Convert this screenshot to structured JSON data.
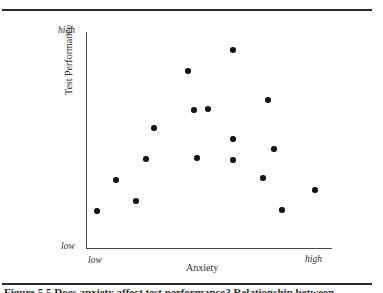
{
  "figure": {
    "caption": "Figure 5.5 Does anxiety affect test performance? Relationship between…",
    "top_rule": true,
    "bottom_rule": true
  },
  "chart_data": {
    "type": "scatter",
    "title": "",
    "xlabel": "Anxiety",
    "ylabel": "Test Performance",
    "x_tick_labels": [
      "low",
      "high"
    ],
    "y_tick_labels": [
      "low",
      "high"
    ],
    "xlim": [
      0,
      100
    ],
    "ylim": [
      0,
      100
    ],
    "grid": false,
    "legend": "none",
    "marker_color": "#141414",
    "axis_color": "#4a4a4a",
    "annotation": "Inverted-U relationship: performance peaks at moderate anxiety.",
    "points": [
      {
        "x": 59.8,
        "y": 92.1
      },
      {
        "x": 41.5,
        "y": 82.3
      },
      {
        "x": 74.0,
        "y": 68.8
      },
      {
        "x": 43.9,
        "y": 64.2
      },
      {
        "x": 49.6,
        "y": 64.7
      },
      {
        "x": 27.6,
        "y": 55.8
      },
      {
        "x": 59.8,
        "y": 50.7
      },
      {
        "x": 76.4,
        "y": 46.0
      },
      {
        "x": 24.4,
        "y": 41.4
      },
      {
        "x": 45.1,
        "y": 41.9
      },
      {
        "x": 59.8,
        "y": 40.9
      },
      {
        "x": 12.2,
        "y": 31.6
      },
      {
        "x": 72.0,
        "y": 32.6
      },
      {
        "x": 93.1,
        "y": 27.0
      },
      {
        "x": 20.3,
        "y": 21.9
      },
      {
        "x": 79.7,
        "y": 17.7
      },
      {
        "x": 4.5,
        "y": 17.2
      }
    ]
  }
}
